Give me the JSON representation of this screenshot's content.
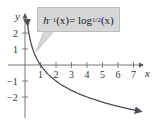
{
  "chart_data": {
    "type": "line",
    "title": "",
    "annotation": "h^{-1}(x) = log_{1/2}(x)",
    "annotation_parts": {
      "func": "h",
      "sup": "−1",
      "arg": "(x)",
      "eq": " = log",
      "sub": "1/2",
      "arg2": "(x)"
    },
    "xlabel": "x",
    "ylabel": "y",
    "xticks": [
      "1",
      "2",
      "3",
      "4",
      "5",
      "6",
      "7"
    ],
    "yticks": [
      "2",
      "1",
      "−1",
      "−2"
    ],
    "xlim": [
      0,
      7.6
    ],
    "ylim": [
      -2.8,
      2.8
    ],
    "grid": false,
    "series": [
      {
        "name": "h^{-1}(x) = log_{1/2}(x)",
        "color": "#4a4f5a",
        "x": [
          0.18,
          0.25,
          0.35,
          0.5,
          0.7,
          1,
          1.5,
          2,
          3,
          4,
          5,
          6,
          7,
          7.5
        ],
        "values": [
          2.47,
          2.0,
          1.51,
          1.0,
          0.51,
          0,
          -0.58,
          -1.0,
          -1.58,
          -2.0,
          -2.32,
          -2.58,
          -2.81,
          -2.91
        ]
      }
    ]
  }
}
